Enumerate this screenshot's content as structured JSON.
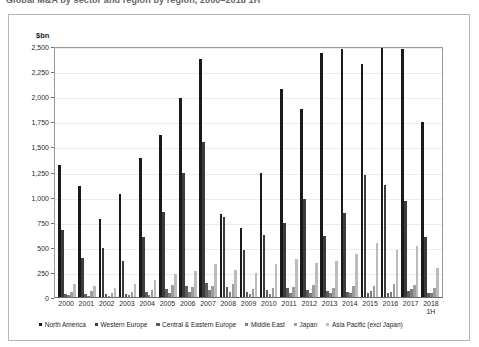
{
  "title": "Global M&A by sector and region by region, 2000–2018 1H",
  "axis_unit": "$bn",
  "legend": {
    "items": [
      {
        "label": "North America",
        "color": "#1a1a1a"
      },
      {
        "label": "Western Europe",
        "color": "#3b3b3b"
      },
      {
        "label": "Central & Eastern Europe",
        "color": "#5e5e5e"
      },
      {
        "label": "Middle East",
        "color": "#7d7d7d"
      },
      {
        "label": "Japan",
        "color": "#9d9d9d"
      },
      {
        "label": "Asia Pacific (excl Japan)",
        "color": "#bcbcbc"
      }
    ]
  },
  "chart_data": {
    "type": "bar",
    "title": "Global M&A by sector and region by region, 2000–2018 1H",
    "xlabel": "",
    "ylabel": "$bn",
    "ylim": [
      0,
      2500
    ],
    "ytick_step": 250,
    "yticks": [
      "0",
      "250",
      "500",
      "750",
      "1,000",
      "1,250",
      "1,500",
      "1,750",
      "2,000",
      "2,250",
      "2,500"
    ],
    "grid": true,
    "legend_position": "bottom",
    "categories": [
      "2000",
      "2001",
      "2002",
      "2003",
      "2004",
      "2005",
      "2006",
      "2007",
      "2008",
      "2009",
      "2010",
      "2011",
      "2012",
      "2013",
      "2014",
      "2015",
      "2016",
      "2017",
      "2018 1H"
    ],
    "category_sublabels": {
      "2018 1H": "1H"
    },
    "series": [
      {
        "name": "North America",
        "color": "#1a1a1a",
        "values": [
          1325,
          1110,
          780,
          1030,
          1400,
          1630,
          2000,
          2390,
          830,
          690,
          1245,
          2090,
          1890,
          2450,
          2490,
          2340,
          2500,
          2495,
          1760
        ]
      },
      {
        "name": "Western Europe",
        "color": "#3b3b3b",
        "values": [
          675,
          390,
          495,
          360,
          600,
          855,
          1245,
          1560,
          805,
          470,
          620,
          745,
          985,
          615,
          845,
          1230,
          1120,
          960,
          600
        ]
      },
      {
        "name": "Central & Eastern Europe",
        "color": "#5e5e5e",
        "values": [
          30,
          35,
          30,
          35,
          55,
          85,
          110,
          145,
          100,
          50,
          70,
          90,
          75,
          60,
          50,
          40,
          45,
          60,
          40
        ]
      },
      {
        "name": "Middle East",
        "color": "#7d7d7d",
        "values": [
          20,
          15,
          12,
          18,
          25,
          40,
          55,
          70,
          50,
          30,
          35,
          40,
          38,
          45,
          40,
          60,
          55,
          80,
          45
        ]
      },
      {
        "name": "Japan",
        "color": "#9d9d9d",
        "values": [
          55,
          60,
          45,
          50,
          75,
          120,
          105,
          115,
          130,
          85,
          90,
          105,
          120,
          95,
          110,
          115,
          130,
          125,
          95
        ]
      },
      {
        "name": "Asia Pacific (excl Japan)",
        "color": "#bcbcbc",
        "values": [
          130,
          110,
          95,
          130,
          175,
          230,
          265,
          330,
          270,
          245,
          330,
          380,
          340,
          365,
          430,
          545,
          470,
          510,
          290
        ]
      }
    ]
  }
}
